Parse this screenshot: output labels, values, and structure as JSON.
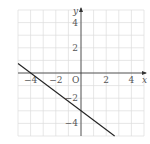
{
  "chart_data": {
    "type": "line",
    "title": "",
    "xlabel": "x",
    "ylabel": "y",
    "origin_label": "O",
    "xlim": [
      -5,
      5
    ],
    "ylim": [
      -5,
      5
    ],
    "grid": true,
    "grid_step": 1,
    "x_ticks": [
      -4,
      -2,
      2,
      4
    ],
    "y_ticks": [
      4,
      2,
      -2,
      -4
    ],
    "x_tick_labels": [
      "−4",
      "−2",
      "2",
      "4"
    ],
    "y_tick_labels": [
      "4",
      "2",
      "−2",
      "−4"
    ],
    "series": [
      {
        "name": "y = -3/4 x - 3",
        "slope": -0.75,
        "intercept": -3,
        "x": [
          -5,
          -4,
          0,
          2.67
        ],
        "y": [
          0.75,
          0,
          -3,
          -5
        ]
      }
    ],
    "colors": {
      "grid": "#dddddd",
      "axis": "#333333",
      "line": "#222222"
    }
  }
}
